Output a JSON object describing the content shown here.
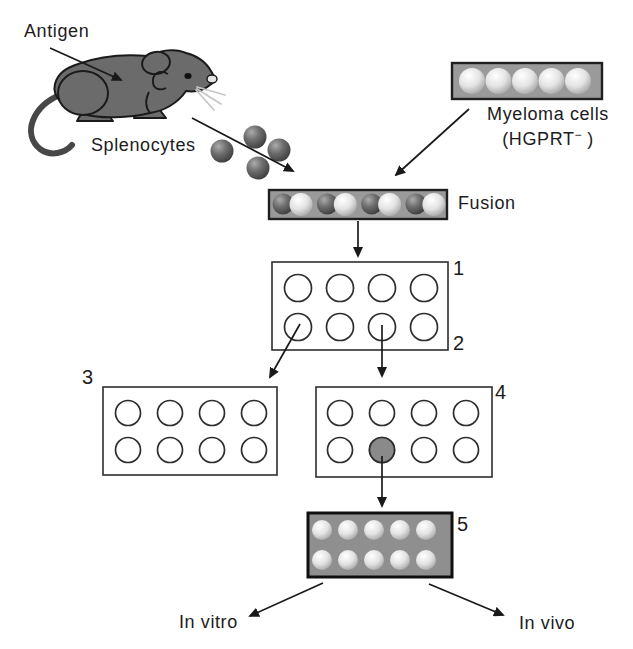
{
  "colors": {
    "background": "#ffffff",
    "outline": "#1a1a1a",
    "mouse_gray": "#6b6b6b",
    "bar_gray": "#9a9a9a",
    "plate5_gray": "#8f8f8f",
    "plate_border": "#2e2e2e",
    "selected_well_gray": "#8a8a8a",
    "dark_cell": "#5a5a5a",
    "light_cell": "#e6e6e6",
    "text_color": "#1c1c1c"
  },
  "labels": {
    "antigen": "Antigen",
    "splenocytes": "Splenocytes",
    "myeloma_line1": "Myeloma cells",
    "myeloma_line2_pre": "(HGPRT",
    "myeloma_line2_sup": "−",
    "myeloma_line2_post": " )",
    "fusion": "Fusion",
    "in_vitro": "In vitro",
    "in_vivo": "In vivo"
  },
  "step_numbers": {
    "one": "1",
    "two": "2",
    "three": "3",
    "four": "4",
    "five": "5"
  },
  "plates": {
    "myeloma_bar": {
      "rows": 1,
      "cols": 5
    },
    "fusion_bar": {
      "rows": 1,
      "cols": 4
    },
    "splenocytes": {
      "rows": 2,
      "cols": 2
    },
    "plate1": {
      "rows": 2,
      "cols": 4
    },
    "plate3": {
      "rows": 2,
      "cols": 4
    },
    "plate4": {
      "rows": 2,
      "cols": 4
    },
    "plate5": {
      "rows": 2,
      "cols": 5
    }
  }
}
